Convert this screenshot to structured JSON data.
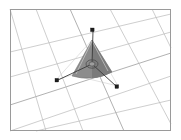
{
  "viewport": {
    "name": "3d-viewport",
    "background_color": "#ffffff",
    "border_color": "#9a9a9a",
    "width": 181,
    "height": 140,
    "frame": {
      "x": 10,
      "y": 9,
      "width": 161,
      "height": 122
    }
  },
  "grid": {
    "name": "perspective-ground-grid",
    "line_color": "#b9b9b9",
    "strong_line_color": "#a3a3a3",
    "direction_a_lines": [
      {
        "x1": 10,
        "y1": 52,
        "x2": 171,
        "y2": 14
      },
      {
        "x1": 10,
        "y1": 77,
        "x2": 171,
        "y2": 32
      },
      {
        "x1": 10,
        "y1": 105,
        "x2": 171,
        "y2": 53
      },
      {
        "x1": 10,
        "y1": 131,
        "x2": 171,
        "y2": 76
      },
      {
        "x1": 36,
        "y1": 131,
        "x2": 171,
        "y2": 100
      }
    ],
    "direction_b_lines": [
      {
        "x1": 10,
        "y1": 9,
        "x2": 46,
        "y2": 131
      },
      {
        "x1": 36,
        "y1": 9,
        "x2": 83,
        "y2": 131
      },
      {
        "x1": 70,
        "y1": 9,
        "x2": 124,
        "y2": 131
      },
      {
        "x1": 110,
        "y1": 9,
        "x2": 171,
        "y2": 124
      },
      {
        "x1": 152,
        "y1": 9,
        "x2": 171,
        "y2": 48
      }
    ]
  },
  "object": {
    "name": "cone-mesh",
    "type": "cone",
    "fill_color": "#8c8c8c",
    "shade_color": "#7b7b7b",
    "edge_color": "#6f6f6f",
    "highlight_color": "#d8d8d8",
    "apex": {
      "x": 92,
      "y": 40
    },
    "base_left": {
      "x": 72,
      "y": 75
    },
    "base_right": {
      "x": 112,
      "y": 72
    }
  },
  "gizmo": {
    "name": "translate-gizmo",
    "handle_color": "#1e1e1e",
    "axis_color": "#3a3a3a",
    "origin": {
      "x": 92,
      "y": 64
    },
    "handles": [
      {
        "label": "axis-handle-up",
        "x": 93,
        "y": 30
      },
      {
        "label": "axis-handle-left",
        "x": 57,
        "y": 80
      },
      {
        "label": "axis-handle-right",
        "x": 117,
        "y": 87
      }
    ],
    "center_ring_radius": 5
  }
}
